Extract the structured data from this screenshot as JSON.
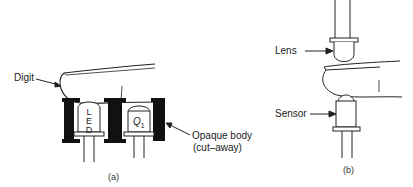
{
  "panel_a": {
    "caption": "(a)",
    "labels": {
      "digit": "Digit",
      "opaque_body_line1": "Opaque body",
      "opaque_body_line2": "(cut–away)"
    },
    "led_letters": [
      "L",
      "E",
      "D"
    ],
    "q1_main": "Q",
    "q1_sub": "1"
  },
  "panel_b": {
    "caption": "(b)",
    "labels": {
      "lens": "Lens",
      "sensor": "Sensor"
    }
  }
}
